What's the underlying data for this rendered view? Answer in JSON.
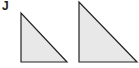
{
  "figure": {
    "label": "J",
    "fill_color": "#e8e8e8",
    "stroke_color": "#222222",
    "shapes": [
      {
        "type": "right-triangle",
        "points": "21,13 21,62 67,62"
      },
      {
        "type": "right-triangle",
        "points": "79,2 79,62 137,62"
      }
    ]
  }
}
